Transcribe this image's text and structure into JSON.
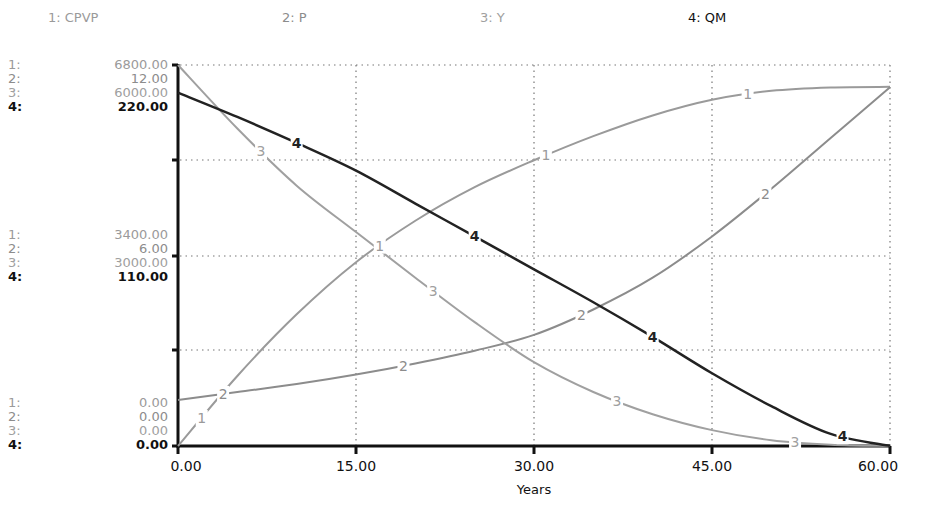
{
  "chart_data": {
    "type": "line",
    "title": "",
    "xlabel": "Years",
    "x_ticks": [
      "0.00",
      "15.00",
      "30.00",
      "45.00",
      "60.00"
    ],
    "xlim": [
      0,
      60
    ],
    "grid": true,
    "legend_position": "top",
    "x": [
      0,
      5,
      10,
      15,
      20,
      25,
      30,
      35,
      40,
      45,
      50,
      55,
      60
    ],
    "series": [
      {
        "id": 1,
        "name": "CPVP",
        "legend": "1: CPVP",
        "color": "#9a9a9a",
        "ylim": [
          0,
          6800
        ],
        "y_ticks": [
          "0.00",
          "3400.00",
          "6800.00"
        ],
        "values": [
          0,
          1250,
          2350,
          3280,
          4020,
          4620,
          5100,
          5530,
          5900,
          6180,
          6340,
          6400,
          6410
        ]
      },
      {
        "id": 2,
        "name": "P",
        "legend": "2: P",
        "color": "#8c8c8c",
        "ylim": [
          0,
          12
        ],
        "y_ticks": [
          "0.00",
          "6.00",
          "12.00"
        ],
        "values": [
          1.45,
          1.7,
          1.95,
          2.25,
          2.6,
          3.0,
          3.5,
          4.3,
          5.3,
          6.6,
          8.1,
          9.7,
          11.3
        ]
      },
      {
        "id": 3,
        "name": "Y",
        "legend": "3: Y",
        "color": "#a0a0a0",
        "ylim": [
          0,
          6000
        ],
        "y_ticks": [
          "0.00",
          "3000.00",
          "6000.00"
        ],
        "values": [
          6000,
          5000,
          4100,
          3370,
          2650,
          1950,
          1320,
          850,
          500,
          250,
          90,
          20,
          0
        ]
      },
      {
        "id": 4,
        "name": "QM",
        "legend": "4: QM",
        "color": "#222222",
        "ylim": [
          0,
          220
        ],
        "y_ticks": [
          "0.00",
          "110.00",
          "220.00"
        ],
        "values": [
          204,
          190,
          175,
          159,
          140,
          121,
          102,
          83,
          63,
          42,
          23,
          7,
          0
        ]
      }
    ]
  },
  "legend": [
    {
      "label": "1: CPVP"
    },
    {
      "label": "2: P"
    },
    {
      "label": "3: Y"
    },
    {
      "label": "4: QM"
    }
  ],
  "y_axis_blocks": {
    "top": [
      {
        "idx": "1:",
        "val": "6800.00"
      },
      {
        "idx": "2:",
        "val": "12.00"
      },
      {
        "idx": "3:",
        "val": "6000.00"
      },
      {
        "idx": "4:",
        "val": "220.00"
      }
    ],
    "mid": [
      {
        "idx": "1:",
        "val": "3400.00"
      },
      {
        "idx": "2:",
        "val": "6.00"
      },
      {
        "idx": "3:",
        "val": "3000.00"
      },
      {
        "idx": "4:",
        "val": "110.00"
      }
    ],
    "bottom": [
      {
        "idx": "1:",
        "val": "0.00"
      },
      {
        "idx": "2:",
        "val": "0.00"
      },
      {
        "idx": "3:",
        "val": "0.00"
      },
      {
        "idx": "4:",
        "val": "0.00"
      }
    ]
  },
  "x_axis": {
    "ticks": [
      "0.00",
      "15.00",
      "30.00",
      "45.00",
      "60.00"
    ],
    "label": "Years"
  }
}
